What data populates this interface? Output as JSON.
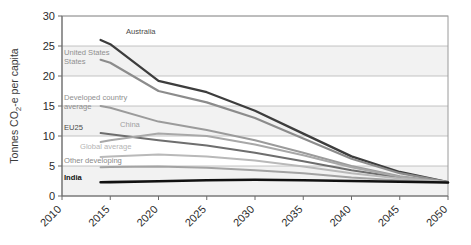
{
  "top_fragment": "",
  "chart_data": {
    "type": "line",
    "title": "",
    "xlabel": "",
    "ylabel": "Tonnes CO2-e per capita",
    "ylabel_parts": {
      "pre": "Tonnes CO",
      "sub": "2",
      "post": "-e per capita"
    },
    "xlim": [
      2010,
      2050
    ],
    "ylim": [
      0,
      30
    ],
    "yticks": [
      0,
      5,
      10,
      15,
      20,
      25,
      30
    ],
    "xticks": [
      2010,
      2015,
      2020,
      2025,
      2030,
      2035,
      2040,
      2045,
      2050
    ],
    "xtick_rotation_deg": 45,
    "grid": "horizontal",
    "legend": "inline-labels",
    "x": [
      2014,
      2015,
      2020,
      2025,
      2030,
      2035,
      2040,
      2045,
      2050
    ],
    "series": [
      {
        "name": "Australia",
        "label": "Australia",
        "color": "#3d3d3d",
        "width": 2.3,
        "label_x": 126,
        "label_y": 34,
        "label_color": "#4a4a4a",
        "label_weight": "normal",
        "values": [
          26.0,
          25.3,
          19.2,
          17.3,
          14.2,
          10.4,
          6.6,
          4.0,
          2.3
        ]
      },
      {
        "name": "United States",
        "label": "United States",
        "color": "#8c8c8c",
        "width": 2.2,
        "label_x": 64,
        "label_y": 55,
        "label_color": "#8f8f8f",
        "label_weight": "normal",
        "label_line2": "States",
        "values": [
          22.7,
          22.2,
          17.5,
          15.6,
          13.0,
          9.6,
          6.2,
          3.8,
          2.3
        ]
      },
      {
        "name": "Developed country average",
        "label": "Developed country",
        "label_line2": "average",
        "color": "#9b9b9b",
        "width": 2.0,
        "label_x": 64,
        "label_y": 100,
        "label_color": "#8f8f8f",
        "label_weight": "normal",
        "values": [
          15.0,
          14.7,
          12.4,
          11.0,
          9.3,
          7.2,
          5.0,
          3.3,
          2.3
        ]
      },
      {
        "name": "EU25",
        "label": "EU25",
        "color": "#6e6e6e",
        "width": 2.0,
        "label_x": 64,
        "label_y": 130,
        "label_color": "#4a4a4a",
        "label_weight": "normal",
        "values": [
          10.5,
          10.3,
          9.3,
          8.4,
          7.2,
          5.8,
          4.3,
          3.1,
          2.3
        ]
      },
      {
        "name": "China",
        "label": "China",
        "color": "#a8a8a8",
        "width": 2.0,
        "label_x": 120,
        "label_y": 127,
        "label_color": "#a0a0a0",
        "label_weight": "normal",
        "values": [
          9.0,
          9.3,
          10.4,
          10.0,
          8.6,
          6.8,
          4.8,
          3.2,
          2.3
        ]
      },
      {
        "name": "Global average",
        "label": "Global average",
        "color": "#b9b9b9",
        "width": 2.0,
        "label_x": 80,
        "label_y": 149,
        "label_color": "#b4b4b4",
        "label_weight": "normal",
        "values": [
          6.5,
          6.6,
          6.9,
          6.6,
          5.9,
          4.9,
          3.8,
          2.9,
          2.3
        ]
      },
      {
        "name": "Other developing",
        "label": "Other developing",
        "color": "#a3a3a3",
        "width": 2.0,
        "label_x": 64,
        "label_y": 163,
        "label_color": "#8a8a8a",
        "label_weight": "normal",
        "values": [
          4.8,
          4.85,
          4.9,
          4.7,
          4.3,
          3.8,
          3.1,
          2.6,
          2.25
        ]
      },
      {
        "name": "India",
        "label": "India",
        "color": "#111111",
        "width": 2.6,
        "label_x": 64,
        "label_y": 180,
        "label_color": "#111111",
        "label_weight": "bold",
        "values": [
          2.3,
          2.32,
          2.45,
          2.62,
          2.7,
          2.62,
          2.5,
          2.38,
          2.25
        ]
      }
    ]
  }
}
